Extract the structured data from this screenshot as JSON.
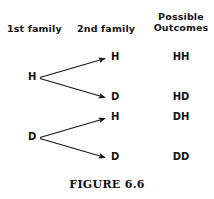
{
  "figure": {
    "caption": "FIGURE 6.6",
    "ink_color": "#141414",
    "background_color": "#ffffff"
  },
  "headers": {
    "first_family": "1st family",
    "second_family": "2nd family",
    "outcomes_line1": "Possible",
    "outcomes_line2": "Outcomes"
  },
  "tree": {
    "branches": [
      {
        "label": "H"
      },
      {
        "label": "D"
      }
    ],
    "leaves": [
      {
        "label": "H"
      },
      {
        "label": "D"
      },
      {
        "label": "H"
      },
      {
        "label": "D"
      }
    ],
    "outcomes": [
      {
        "label": "HH"
      },
      {
        "label": "HD"
      },
      {
        "label": "DH"
      },
      {
        "label": "DD"
      }
    ]
  }
}
